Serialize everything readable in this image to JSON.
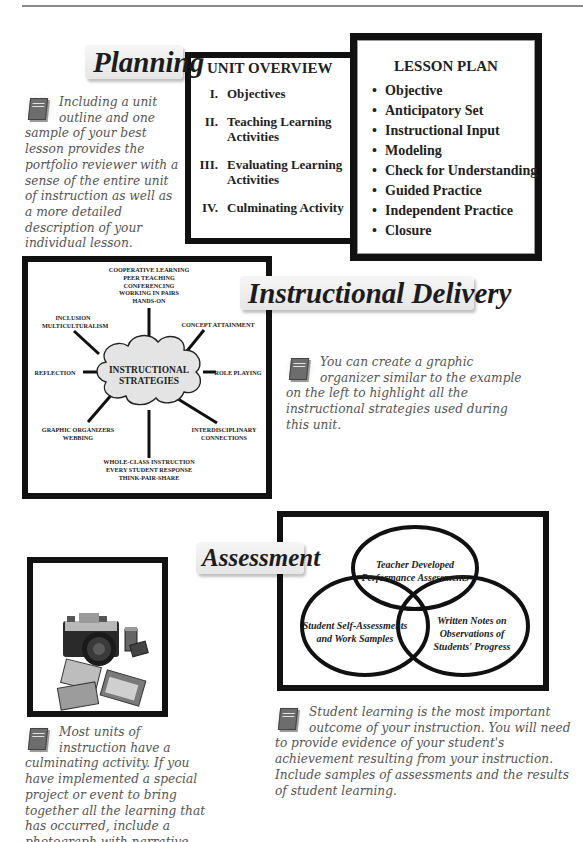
{
  "planning": {
    "section_title": "Planning",
    "callout_text": "Including a unit outline and one sample of your best lesson provides the portfolio reviewer with a sense of the entire unit of instruction as well as a more detailed description of your individual lesson.",
    "unit_overview": {
      "title": "UNIT OVERVIEW",
      "items": [
        {
          "num": "I.",
          "label": "Objectives"
        },
        {
          "num": "II.",
          "label": "Teaching Learning Activities"
        },
        {
          "num": "III.",
          "label": "Evaluating Learning Activities"
        },
        {
          "num": "IV.",
          "label": "Culminating Activity"
        }
      ]
    },
    "lesson_plan": {
      "title": "LESSON PLAN",
      "items": [
        "Objective",
        "Anticipatory Set",
        "Instructional Input",
        "Modeling",
        "Check for Understanding",
        "Guided Practice",
        "Independent Practice",
        "Closure"
      ]
    }
  },
  "delivery": {
    "section_title": "Instructional Delivery",
    "callout_text": "You can create a graphic organizer similar to the example on the left to highlight all the instructional strategies used during this unit.",
    "diagram": {
      "center": [
        "INSTRUCTIONAL",
        "STRATEGIES"
      ],
      "top": [
        "COOPERATIVE LEARNING",
        "PEER TEACHING",
        "CONFERENCING",
        "WORKING IN PAIRS",
        "HANDS-ON"
      ],
      "top_left": [
        "INCLUSION",
        "MULTICULTURALISM"
      ],
      "top_right": [
        "CONCEPT ATTAINMENT"
      ],
      "left": [
        "REFLECTION"
      ],
      "right": [
        "ROLE PLAYING"
      ],
      "bottom_left": [
        "GRAPHIC ORGANIZERS",
        "WEBBING"
      ],
      "bottom_right": [
        "INTERDISCIPLINARY",
        "CONNECTIONS"
      ],
      "bottom": [
        "WHOLE-CLASS INSTRUCTION",
        "EVERY STUDENT RESPONSE",
        "THINK-PAIR-SHARE"
      ]
    }
  },
  "assessment": {
    "section_title": "Assessment",
    "photo_callout_text": "Most units of instruction have a culminating activity. If you have implemented a special project or event to bring together all the learning that has occurred, include a photograph with narrative about this activity.",
    "venn_callout_text": "Student learning is the most important outcome of your instruction. You will need to provide evidence of your student's achievement resulting from your instruction. Include samples of assessments and the results of student learning.",
    "venn": {
      "top": [
        "Teacher Developed",
        "Performance Assessments"
      ],
      "left": [
        "Student Self-Assessments",
        "and Work Samples"
      ],
      "right": [
        "Written Notes on",
        "Observations of",
        "Students' Progress"
      ]
    }
  },
  "icons": {
    "portfolio_book": "teaching-portfolio-book-icon",
    "photo": "camera-and-photos-clipart"
  }
}
